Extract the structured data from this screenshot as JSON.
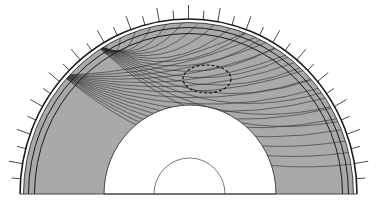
{
  "diagram": {
    "colors": {
      "background": "#ffffff",
      "mantle_fill": "#a9a9a9",
      "outline": "#1a1a1a",
      "ray": "#2b2b2b",
      "core_fill": "#ffffff",
      "tick": "#333333"
    },
    "geometry": {
      "center": [
        188.5,
        194
      ],
      "surface": {
        "rx": 168.5,
        "ry": 175
      },
      "layer_lines": [
        {
          "rx": 165,
          "ry": 171.5
        },
        {
          "rx": 160,
          "ry": 166.5
        },
        {
          "rx": 154,
          "ry": 160.5
        }
      ],
      "outer_core": {
        "cx": 190,
        "rx": 86,
        "ry": 89
      },
      "inner_core": {
        "cx": 189.5,
        "rx": 35.5,
        "ry": 36
      },
      "anomaly": {
        "cx": 207,
        "cy": 79,
        "rx": 24,
        "ry": 14,
        "style": "dashed"
      }
    },
    "ticks": {
      "step_deg": 5,
      "start_deg": 5,
      "end_deg": 175,
      "long_len": 14,
      "short_len": 9
    },
    "sources": [
      {
        "name": "source-upper",
        "x": 98,
        "y": 46
      },
      {
        "name": "source-lower",
        "x": 62,
        "y": 75
      }
    ],
    "ray_bundles": [
      {
        "source": 0,
        "count": 18,
        "end_deg_from": 120,
        "end_deg_to": 25
      },
      {
        "source": 1,
        "count": 16,
        "end_deg_from": 70,
        "end_deg_to": 10
      }
    ]
  }
}
